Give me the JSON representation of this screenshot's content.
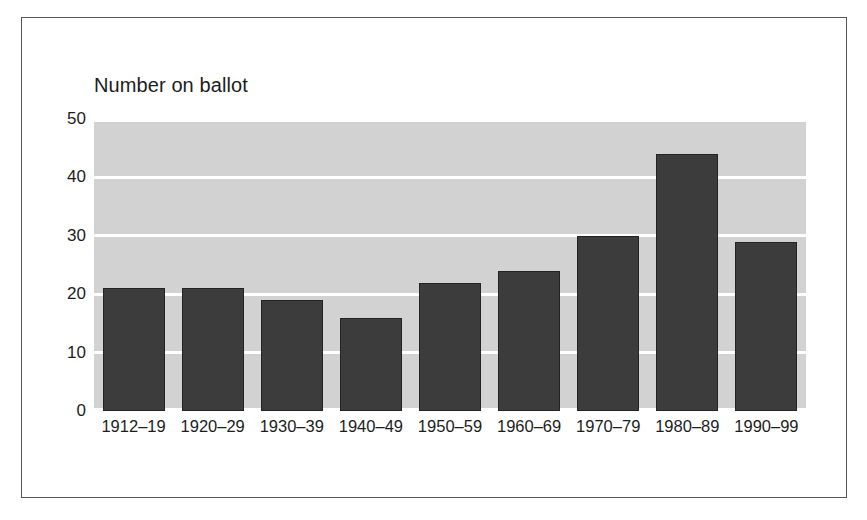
{
  "chart_data": {
    "type": "bar",
    "title": "Number on ballot",
    "xlabel": "",
    "ylabel": "",
    "categories": [
      "1912–19",
      "1920–29",
      "1930–39",
      "1940–49",
      "1950–59",
      "1960–69",
      "1970–79",
      "1980–89",
      "1990–99"
    ],
    "values": [
      21,
      21,
      19,
      16,
      22,
      24,
      30,
      44,
      29
    ],
    "ylim": [
      0,
      50
    ],
    "yticks": [
      0,
      10,
      20,
      30,
      40,
      50
    ],
    "ytick_labels": [
      "0",
      "10",
      "20",
      "30",
      "40",
      "50"
    ],
    "grid": true,
    "legend": false,
    "colors": {
      "bar_fill": "#3c3c3c",
      "bar_edge": "#232323",
      "plot_background": "#d2d2d2",
      "gridline": "#ffffff",
      "frame_border": "#54565a",
      "text": "#1d1d1d",
      "page_background": "#ffffff"
    }
  }
}
